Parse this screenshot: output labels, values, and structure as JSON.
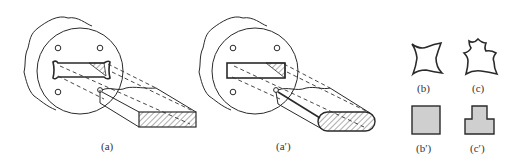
{
  "figure": {
    "panels": [
      {
        "id": "a",
        "label": "(a)",
        "description": "Extrusion die with dog-bone shaped orifice producing rectangular bar with hatched cross-section"
      },
      {
        "id": "a_prime",
        "label": "(a′)",
        "description": "Extrusion die with rectangular orifice producing bar with rounded hatched cross-section"
      },
      {
        "id": "b",
        "label": "(b)",
        "description": "Die orifice shape: concave-sided square (four-pointed)"
      },
      {
        "id": "c",
        "label": "(c)",
        "description": "Die orifice shape: irregular star-like stepped profile"
      },
      {
        "id": "b_prime",
        "label": "(b′)",
        "description": "Resulting cross-section: square"
      },
      {
        "id": "c_prime",
        "label": "(c′)",
        "description": "Resulting cross-section: stepped T-shape"
      }
    ],
    "colors": {
      "line": "#2a2a2a",
      "fill": "#cfcfcf",
      "background": "#ffffff"
    }
  }
}
